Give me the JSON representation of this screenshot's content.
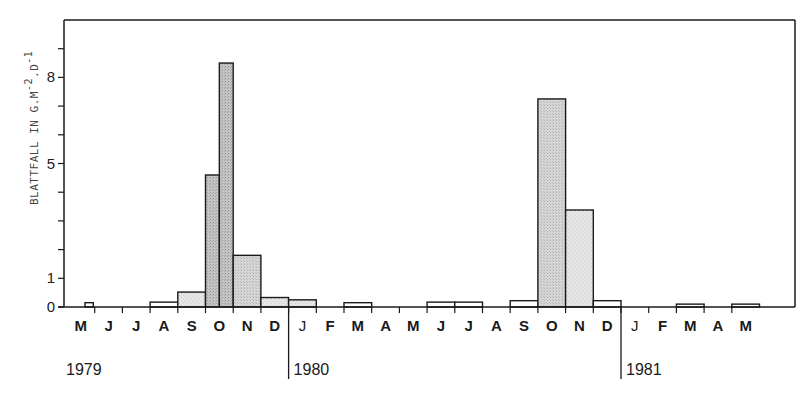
{
  "chart_data": {
    "type": "bar",
    "title": "",
    "ylabel": "BLATTFALL IN G.M-2.D-1",
    "ylabel_parts": {
      "main": "BLATTFALL IN G.M",
      "sup1": "-2",
      "mid": ".D",
      "sup2": "-1"
    },
    "xlabel": "",
    "ylim": [
      0,
      10
    ],
    "yticks": [
      0,
      1,
      2,
      3,
      4,
      5,
      6,
      7,
      8,
      9
    ],
    "ytick_labels": [
      {
        "value": 0,
        "label": "0"
      },
      {
        "value": 1,
        "label": "1"
      },
      {
        "value": 5,
        "label": "5"
      },
      {
        "value": 8,
        "label": "8"
      }
    ],
    "grid": false,
    "legend": null,
    "months": [
      "M",
      "J",
      "J",
      "A",
      "S",
      "O",
      "N",
      "D",
      "J",
      "F",
      "M",
      "A",
      "M",
      "J",
      "J",
      "A",
      "S",
      "O",
      "N",
      "D",
      "J",
      "F",
      "M",
      "A",
      "M"
    ],
    "years": [
      {
        "label": "1979",
        "month_index": 0
      },
      {
        "label": "1980",
        "month_index": 8
      },
      {
        "label": "1981",
        "month_index": 20
      }
    ],
    "bars": [
      {
        "period": "May 1979 (late)",
        "start": 0.65,
        "end": 0.95,
        "value": 0.15,
        "shade": "none"
      },
      {
        "period": "Aug 1979",
        "start": 3,
        "end": 4,
        "value": 0.17,
        "shade": "none"
      },
      {
        "period": "Sep 1979",
        "start": 4,
        "end": 5,
        "value": 0.52,
        "shade": "light"
      },
      {
        "period": "Oct 1979 (1st half)",
        "start": 5,
        "end": 5.5,
        "value": 4.6,
        "shade": "dark"
      },
      {
        "period": "Oct 1979 (2nd half)",
        "start": 5.5,
        "end": 6,
        "value": 8.5,
        "shade": "dark"
      },
      {
        "period": "Nov 1979",
        "start": 6,
        "end": 7,
        "value": 1.8,
        "shade": "medium"
      },
      {
        "period": "Dec 1979",
        "start": 7,
        "end": 8,
        "value": 0.33,
        "shade": "light"
      },
      {
        "period": "Jan 1980",
        "start": 8,
        "end": 9,
        "value": 0.25,
        "shade": "light"
      },
      {
        "period": "Mar 1980",
        "start": 10,
        "end": 11,
        "value": 0.15,
        "shade": "none"
      },
      {
        "period": "Jun 1980",
        "start": 13,
        "end": 14,
        "value": 0.17,
        "shade": "none"
      },
      {
        "period": "Jul 1980",
        "start": 14,
        "end": 15,
        "value": 0.17,
        "shade": "none"
      },
      {
        "period": "Sep 1980",
        "start": 16,
        "end": 17,
        "value": 0.22,
        "shade": "none"
      },
      {
        "period": "Oct 1980",
        "start": 17,
        "end": 18,
        "value": 7.25,
        "shade": "medium"
      },
      {
        "period": "Nov 1980",
        "start": 18,
        "end": 19,
        "value": 3.38,
        "shade": "light"
      },
      {
        "period": "Dec 1980",
        "start": 19,
        "end": 20,
        "value": 0.22,
        "shade": "none"
      },
      {
        "period": "Mar 1981",
        "start": 22,
        "end": 23,
        "value": 0.1,
        "shade": "none"
      },
      {
        "period": "May 1981",
        "start": 24,
        "end": 25,
        "value": 0.1,
        "shade": "none"
      }
    ],
    "categories": [
      "May79",
      "Jun79",
      "Jul79",
      "Aug79",
      "Sep79",
      "Oct79",
      "Nov79",
      "Dec79",
      "Jan80",
      "Feb80",
      "Mar80",
      "Apr80",
      "May80",
      "Jun80",
      "Jul80",
      "Aug80",
      "Sep80",
      "Oct80",
      "Nov80",
      "Dec80",
      "Jan81",
      "Feb81",
      "Mar81",
      "Apr81",
      "May81"
    ],
    "values": [
      0.15,
      0,
      0,
      0.17,
      0.52,
      6.55,
      1.8,
      0.33,
      0.25,
      0,
      0.15,
      0,
      0,
      0.17,
      0.17,
      0,
      0.22,
      7.25,
      3.38,
      0.22,
      0,
      0,
      0.1,
      0,
      0.1
    ],
    "values_note": "Oct 1979 shown as two half-month bars: 4.6 and 8.5"
  },
  "colors": {
    "frame": "#1a1a1a",
    "shade_dark": "#bdbdbd",
    "shade_medium": "#d2d2d2",
    "shade_light": "#e3e3e3",
    "shade_none": "#ffffff"
  }
}
